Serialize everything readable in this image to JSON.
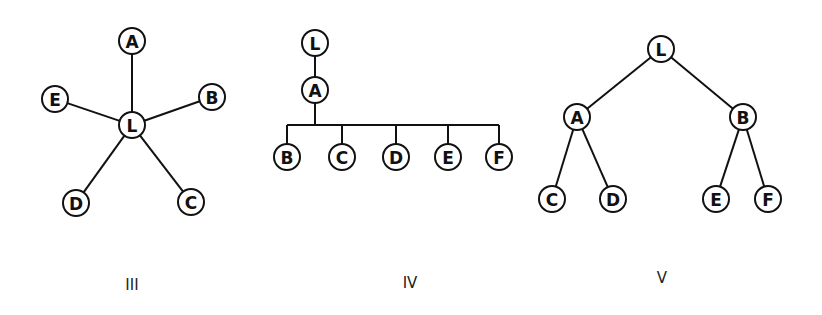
{
  "colors": {
    "ink": "#111111",
    "background": "#ffffff"
  },
  "diagrams": [
    {
      "caption": "III",
      "type": "star",
      "nodes": [
        {
          "id": "L",
          "label": "L",
          "x": 132,
          "y": 125
        },
        {
          "id": "A",
          "label": "A",
          "x": 132,
          "y": 41
        },
        {
          "id": "B",
          "label": "B",
          "x": 212,
          "y": 97
        },
        {
          "id": "C",
          "label": "C",
          "x": 191,
          "y": 202
        },
        {
          "id": "D",
          "label": "D",
          "x": 76,
          "y": 203
        },
        {
          "id": "E",
          "label": "E",
          "x": 55,
          "y": 99
        }
      ],
      "edges": [
        [
          "L",
          "A"
        ],
        [
          "L",
          "B"
        ],
        [
          "L",
          "C"
        ],
        [
          "L",
          "D"
        ],
        [
          "L",
          "E"
        ]
      ],
      "caption_pos": {
        "x": 132,
        "y": 290
      }
    },
    {
      "caption": "IV",
      "type": "chain-with-bus",
      "nodes": [
        {
          "id": "L",
          "label": "L",
          "x": 315,
          "y": 43
        },
        {
          "id": "A",
          "label": "A",
          "x": 315,
          "y": 90
        },
        {
          "id": "B",
          "label": "B",
          "x": 287,
          "y": 157
        },
        {
          "id": "C",
          "label": "C",
          "x": 342,
          "y": 157
        },
        {
          "id": "D",
          "label": "D",
          "x": 396,
          "y": 157
        },
        {
          "id": "E",
          "label": "E",
          "x": 448,
          "y": 157
        },
        {
          "id": "F",
          "label": "F",
          "x": 499,
          "y": 157
        }
      ],
      "edges": [
        [
          "L",
          "A"
        ]
      ],
      "bus": {
        "from": "A",
        "y": 125,
        "x1": 287,
        "x2": 499,
        "children": [
          "B",
          "C",
          "D",
          "E",
          "F"
        ]
      },
      "caption_pos": {
        "x": 410,
        "y": 288
      }
    },
    {
      "caption": "V",
      "type": "binary-tree",
      "nodes": [
        {
          "id": "L",
          "label": "L",
          "x": 661,
          "y": 49
        },
        {
          "id": "A",
          "label": "A",
          "x": 577,
          "y": 117
        },
        {
          "id": "B",
          "label": "B",
          "x": 743,
          "y": 117
        },
        {
          "id": "C",
          "label": "C",
          "x": 552,
          "y": 199
        },
        {
          "id": "D",
          "label": "D",
          "x": 613,
          "y": 199
        },
        {
          "id": "E",
          "label": "E",
          "x": 716,
          "y": 199
        },
        {
          "id": "F",
          "label": "F",
          "x": 768,
          "y": 199
        }
      ],
      "edges": [
        [
          "L",
          "A"
        ],
        [
          "L",
          "B"
        ],
        [
          "A",
          "C"
        ],
        [
          "A",
          "D"
        ],
        [
          "B",
          "E"
        ],
        [
          "B",
          "F"
        ]
      ],
      "caption_pos": {
        "x": 662,
        "y": 283
      }
    }
  ]
}
